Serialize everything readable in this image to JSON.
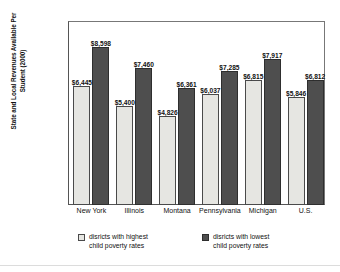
{
  "chart_data": {
    "type": "bar",
    "title": "",
    "xlabel": "",
    "ylabel": "State and Local Revenues\nAvailable Per Student (2000)",
    "ylim": [
      0,
      10000
    ],
    "ytick_labels": [
      "$10,000",
      "$8,000",
      "$6,000",
      "$4,000",
      "$2,000",
      "0"
    ],
    "ytick_values": [
      10000,
      8000,
      6000,
      4000,
      2000,
      0
    ],
    "grid": false,
    "legend_position": "bottom",
    "categories": [
      "New York",
      "Illinois",
      "Montana",
      "Pennsylvania",
      "Michigan",
      "U.S."
    ],
    "series": [
      {
        "name": "disricts with highest\nchild poverty rates",
        "color": "#e6e6e2",
        "values": [
          6445,
          5400,
          4826,
          6037,
          6815,
          5846
        ],
        "labels": [
          "$6,445",
          "$5,400",
          "$4,826",
          "$6,037",
          "$6,815",
          "$5,846"
        ]
      },
      {
        "name": "disricts with lowest\nchild poverty rates",
        "color": "#4e4e4e",
        "values": [
          8598,
          7460,
          6361,
          7285,
          7917,
          6812
        ],
        "labels": [
          "$8,598",
          "$7,460",
          "$6,361",
          "$7,285",
          "$7,917",
          "$6,812"
        ]
      }
    ]
  }
}
